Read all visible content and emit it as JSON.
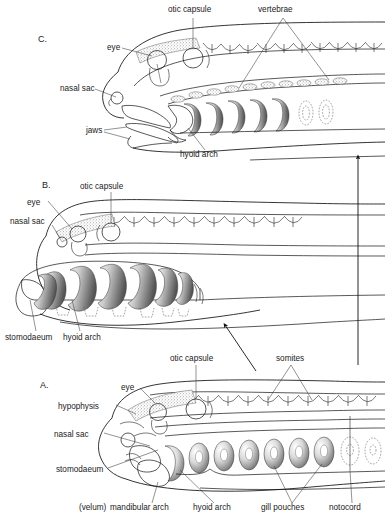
{
  "figure": {
    "background_color": "#ffffff",
    "ink_color": "#1a1a1a",
    "width": 385,
    "height": 520
  },
  "panels": [
    {
      "id": "C",
      "letter": "C.",
      "stage_name": "jawed-vertebrate stage",
      "labels": [
        {
          "name": "otic capsule",
          "text": "otic capsule",
          "x": 168,
          "y": 12,
          "anchor": "start"
        },
        {
          "name": "vertebrae",
          "text": "vertebrae",
          "x": 258,
          "y": 12,
          "anchor": "start"
        },
        {
          "name": "eye",
          "text": "eye",
          "x": 107,
          "y": 50,
          "anchor": "start"
        },
        {
          "name": "nasal sac",
          "text": "nasal sac",
          "x": 60,
          "y": 85,
          "anchor": "start"
        },
        {
          "name": "jaws",
          "text": "jaws",
          "x": 86,
          "y": 130,
          "anchor": "start"
        },
        {
          "name": "hyoid arch",
          "text": "hyoid arch",
          "x": 180,
          "y": 156,
          "anchor": "start"
        }
      ]
    },
    {
      "id": "B",
      "letter": "B.",
      "stage_name": "intermediate agnathan stage",
      "labels": [
        {
          "name": "otic capsule",
          "text": "otic capsule",
          "x": 80,
          "y": 187,
          "anchor": "start"
        },
        {
          "name": "eye",
          "text": "eye",
          "x": 27,
          "y": 204,
          "anchor": "start"
        },
        {
          "name": "nasal sac",
          "text": "nasal sac",
          "x": 14,
          "y": 221,
          "anchor": "start"
        },
        {
          "name": "stomodaeum",
          "text": "stomodaeum",
          "x": 6,
          "y": 338,
          "anchor": "start"
        },
        {
          "name": "hyoid arch",
          "text": "hyoid arch",
          "x": 64,
          "y": 338,
          "anchor": "start"
        }
      ]
    },
    {
      "id": "A",
      "letter": "A.",
      "stage_name": "primitive pharyngeal stage",
      "labels": [
        {
          "name": "otic capsule",
          "text": "otic capsule",
          "x": 170,
          "y": 359,
          "anchor": "start"
        },
        {
          "name": "somites",
          "text": "somites",
          "x": 276,
          "y": 359,
          "anchor": "start"
        },
        {
          "name": "eye",
          "text": "eye",
          "x": 122,
          "y": 389,
          "anchor": "start"
        },
        {
          "name": "hypophysis",
          "text": "hypophysis",
          "x": 60,
          "y": 408,
          "anchor": "start"
        },
        {
          "name": "nasal sac",
          "text": "nasal sac",
          "x": 55,
          "y": 436,
          "anchor": "start"
        },
        {
          "name": "stomodaeum",
          "text": "stomodaeum",
          "x": 58,
          "y": 471,
          "anchor": "start"
        },
        {
          "name": "velum",
          "text": "(velum)",
          "x": 80,
          "y": 509,
          "anchor": "start"
        },
        {
          "name": "mandibular arch",
          "text": "mandibular arch",
          "x": 110,
          "y": 509,
          "anchor": "start"
        },
        {
          "name": "hyoid arch",
          "text": "hyoid arch",
          "x": 194,
          "y": 509,
          "anchor": "start"
        },
        {
          "name": "gill pouches",
          "text": "gill pouches",
          "x": 262,
          "y": 509,
          "anchor": "start"
        },
        {
          "name": "notocord",
          "text": "notocord",
          "x": 330,
          "y": 509,
          "anchor": "start"
        }
      ]
    }
  ],
  "annotations": {
    "evolution_arrow": {
      "name": "evolution-direction-arrow",
      "orientation": "vertical-up",
      "x": 358,
      "y_top": 155,
      "y_bottom": 365
    },
    "transition_arrow": {
      "name": "panel-transition-arrow",
      "orientation": "diagonal-up-left",
      "x1": 256,
      "y1": 371,
      "x2": 224,
      "y2": 324
    }
  }
}
